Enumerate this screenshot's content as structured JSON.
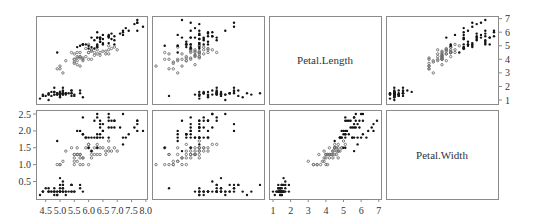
{
  "chart_data": {
    "type": "scatter",
    "title": "",
    "variables": [
      "Sepal.Length",
      "Sepal.Width",
      "Petal.Length",
      "Petal.Width"
    ],
    "layout": {
      "rows": [
        "Petal.Length",
        "Petal.Width"
      ],
      "cols": [
        "Sepal.Length",
        "Sepal.Width",
        "Petal.Length",
        "Petal.Width"
      ]
    },
    "diagonal_labels": {
      "Petal.Length": "Petal.Length",
      "Petal.Width": "Petal.Width"
    },
    "axes": {
      "Sepal.Length": {
        "ticks": [
          "4.5",
          "5.0",
          "5.5",
          "6.0",
          "6.5",
          "7.0",
          "7.5",
          "8.0"
        ],
        "range": [
          4.3,
          8.0
        ],
        "position": "bottom"
      },
      "Sepal.Width": {
        "ticks": [],
        "range": [
          2.0,
          4.4
        ]
      },
      "Petal.Length": {
        "ticks": [
          "1",
          "2",
          "3",
          "4",
          "5",
          "6",
          "7"
        ],
        "range": [
          1,
          7
        ],
        "position": "bottom,right"
      },
      "Petal.Width": {
        "ticks": [
          "0.5",
          "1.0",
          "1.5",
          "2.0",
          "2.5"
        ],
        "range": [
          0.1,
          2.5
        ],
        "position": "left"
      }
    },
    "grid": false,
    "legend": null,
    "series": [
      {
        "name": "setosa",
        "color": "#222222"
      },
      {
        "name": "versicolor",
        "color": "#777777"
      },
      {
        "name": "virginica",
        "color": "#111111"
      }
    ],
    "points": {
      "Sepal.Length": [
        5.1,
        4.9,
        4.7,
        4.6,
        5.0,
        5.4,
        4.6,
        5.0,
        4.4,
        4.9,
        5.4,
        4.8,
        4.8,
        4.3,
        5.8,
        5.7,
        5.4,
        5.1,
        5.7,
        5.1,
        5.4,
        5.1,
        4.6,
        5.1,
        4.8,
        5.0,
        5.0,
        5.2,
        5.2,
        4.7,
        4.8,
        5.4,
        5.2,
        5.5,
        4.9,
        5.0,
        5.5,
        4.9,
        4.4,
        5.1,
        5.0,
        4.5,
        4.4,
        5.0,
        5.1,
        4.8,
        5.1,
        4.6,
        5.3,
        5.0,
        7.0,
        6.4,
        6.9,
        5.5,
        6.5,
        5.7,
        6.3,
        4.9,
        6.6,
        5.2,
        5.0,
        5.9,
        6.0,
        6.1,
        5.6,
        6.7,
        5.6,
        5.8,
        6.2,
        5.6,
        5.9,
        6.1,
        6.3,
        6.1,
        6.4,
        6.6,
        6.8,
        6.7,
        6.0,
        5.7,
        5.5,
        5.5,
        5.8,
        6.0,
        5.4,
        6.0,
        6.7,
        6.3,
        5.6,
        5.5,
        5.5,
        6.1,
        5.8,
        5.0,
        5.6,
        5.7,
        5.7,
        6.2,
        5.1,
        5.7,
        6.3,
        5.8,
        7.1,
        6.3,
        6.5,
        7.6,
        4.9,
        7.3,
        6.7,
        7.2,
        6.5,
        6.4,
        6.8,
        5.7,
        5.8,
        6.4,
        6.5,
        7.7,
        7.7,
        6.0,
        6.9,
        5.6,
        7.7,
        6.3,
        6.7,
        7.2,
        6.2,
        6.1,
        6.4,
        7.2,
        7.4,
        7.9,
        6.4,
        6.3,
        6.1,
        7.7,
        6.3,
        6.4,
        6.0,
        6.9,
        6.7,
        6.9,
        5.8,
        6.8,
        6.7,
        6.7,
        6.3,
        6.5,
        6.2,
        5.9
      ],
      "Sepal.Width": [
        3.5,
        3.0,
        3.2,
        3.1,
        3.6,
        3.9,
        3.4,
        3.4,
        2.9,
        3.1,
        3.7,
        3.4,
        3.0,
        3.0,
        4.0,
        4.4,
        3.9,
        3.5,
        3.8,
        3.8,
        3.4,
        3.7,
        3.6,
        3.3,
        3.4,
        3.0,
        3.4,
        3.5,
        3.4,
        3.2,
        3.1,
        3.4,
        4.1,
        4.2,
        3.1,
        3.2,
        3.5,
        3.6,
        3.0,
        3.4,
        3.5,
        2.3,
        3.2,
        3.5,
        3.8,
        3.0,
        3.8,
        3.2,
        3.7,
        3.3,
        3.2,
        3.2,
        3.1,
        2.3,
        2.8,
        2.8,
        3.3,
        2.4,
        2.9,
        2.7,
        2.0,
        3.0,
        2.2,
        2.9,
        2.9,
        3.1,
        3.0,
        2.7,
        2.2,
        2.5,
        3.2,
        2.8,
        2.5,
        2.8,
        2.9,
        3.0,
        2.8,
        3.0,
        2.9,
        2.6,
        2.4,
        2.4,
        2.7,
        2.7,
        3.0,
        3.4,
        3.1,
        2.3,
        3.0,
        2.5,
        2.6,
        3.0,
        2.6,
        2.3,
        2.7,
        3.0,
        2.9,
        2.9,
        2.5,
        2.8,
        3.3,
        2.7,
        3.0,
        2.9,
        3.0,
        3.0,
        2.5,
        2.9,
        2.5,
        3.6,
        3.2,
        2.7,
        3.0,
        2.5,
        2.8,
        3.2,
        3.0,
        3.8,
        2.6,
        2.2,
        3.2,
        2.8,
        2.8,
        2.7,
        3.3,
        3.2,
        2.8,
        3.0,
        2.8,
        3.0,
        2.8,
        3.8,
        2.8,
        2.8,
        2.6,
        3.0,
        3.4,
        3.1,
        3.0,
        3.1,
        3.1,
        3.1,
        2.7,
        3.2,
        3.3,
        3.0,
        2.5,
        3.0,
        3.4,
        3.0
      ],
      "Petal.Length": [
        1.4,
        1.4,
        1.3,
        1.5,
        1.4,
        1.7,
        1.4,
        1.5,
        1.4,
        1.5,
        1.5,
        1.6,
        1.4,
        1.1,
        1.2,
        1.5,
        1.3,
        1.4,
        1.7,
        1.5,
        1.7,
        1.5,
        1.0,
        1.7,
        1.9,
        1.6,
        1.6,
        1.5,
        1.4,
        1.6,
        1.6,
        1.5,
        1.5,
        1.4,
        1.5,
        1.2,
        1.3,
        1.4,
        1.3,
        1.5,
        1.3,
        1.3,
        1.3,
        1.6,
        1.9,
        1.4,
        1.6,
        1.4,
        1.5,
        1.4,
        4.7,
        4.5,
        4.9,
        4.0,
        4.6,
        4.5,
        4.7,
        3.3,
        4.6,
        3.9,
        3.5,
        4.2,
        4.0,
        4.7,
        3.6,
        4.4,
        4.5,
        4.1,
        4.5,
        3.9,
        4.8,
        4.0,
        4.9,
        4.7,
        4.3,
        4.4,
        4.8,
        5.0,
        4.5,
        3.5,
        3.8,
        3.7,
        3.9,
        5.1,
        4.5,
        4.5,
        4.7,
        4.4,
        4.1,
        4.0,
        4.4,
        4.6,
        4.0,
        3.3,
        4.2,
        4.2,
        4.2,
        4.3,
        3.0,
        4.1,
        6.0,
        5.1,
        5.9,
        5.6,
        5.8,
        6.6,
        4.5,
        6.3,
        5.8,
        6.1,
        5.1,
        5.3,
        5.5,
        5.0,
        5.1,
        5.3,
        5.5,
        6.7,
        6.9,
        5.0,
        5.7,
        4.9,
        6.7,
        4.9,
        5.7,
        6.0,
        4.8,
        4.9,
        5.6,
        5.8,
        6.1,
        6.4,
        5.6,
        5.1,
        5.6,
        6.1,
        5.6,
        5.5,
        4.8,
        5.4,
        5.6,
        5.1,
        5.1,
        5.9,
        5.7,
        5.2,
        5.0,
        5.2,
        5.4,
        5.1
      ],
      "Petal.Width": [
        0.2,
        0.2,
        0.2,
        0.2,
        0.2,
        0.4,
        0.3,
        0.2,
        0.2,
        0.1,
        0.2,
        0.2,
        0.1,
        0.1,
        0.2,
        0.4,
        0.4,
        0.3,
        0.3,
        0.3,
        0.2,
        0.4,
        0.2,
        0.5,
        0.2,
        0.2,
        0.4,
        0.2,
        0.2,
        0.2,
        0.2,
        0.4,
        0.1,
        0.2,
        0.2,
        0.2,
        0.2,
        0.1,
        0.2,
        0.2,
        0.3,
        0.3,
        0.2,
        0.6,
        0.4,
        0.3,
        0.2,
        0.2,
        0.2,
        0.2,
        1.4,
        1.5,
        1.5,
        1.3,
        1.5,
        1.3,
        1.6,
        1.0,
        1.3,
        1.4,
        1.0,
        1.5,
        1.0,
        1.4,
        1.3,
        1.4,
        1.5,
        1.0,
        1.5,
        1.1,
        1.8,
        1.3,
        1.5,
        1.2,
        1.3,
        1.4,
        1.4,
        1.7,
        1.5,
        1.0,
        1.1,
        1.0,
        1.2,
        1.6,
        1.5,
        1.6,
        1.5,
        1.3,
        1.3,
        1.3,
        1.2,
        1.4,
        1.2,
        1.0,
        1.3,
        1.2,
        1.3,
        1.3,
        1.1,
        1.3,
        2.5,
        1.9,
        2.1,
        1.8,
        2.2,
        2.1,
        1.7,
        1.8,
        1.8,
        2.5,
        2.0,
        1.9,
        2.1,
        2.0,
        2.4,
        2.3,
        1.8,
        2.2,
        2.3,
        1.5,
        2.3,
        2.0,
        2.0,
        1.8,
        2.1,
        1.8,
        1.8,
        1.8,
        2.1,
        1.6,
        1.9,
        2.0,
        2.2,
        1.5,
        1.4,
        2.3,
        2.4,
        1.8,
        1.8,
        2.1,
        2.4,
        2.3,
        1.9,
        2.3,
        2.5,
        2.3,
        1.9,
        2.0,
        2.3,
        1.8
      ]
    }
  }
}
